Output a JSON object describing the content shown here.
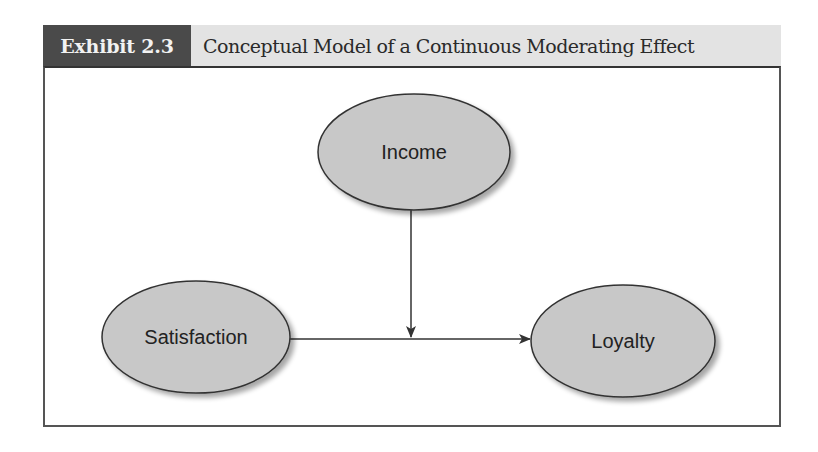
{
  "exhibit": {
    "label": "Exhibit 2.3",
    "title": "Conceptual Model of a Continuous Moderating Effect"
  },
  "diagram": {
    "nodes": [
      {
        "id": "income",
        "label": "Income",
        "role": "moderator"
      },
      {
        "id": "satisfaction",
        "label": "Satisfaction",
        "role": "independent"
      },
      {
        "id": "loyalty",
        "label": "Loyalty",
        "role": "dependent"
      }
    ],
    "edges": [
      {
        "from": "satisfaction",
        "to": "loyalty",
        "type": "direct-path"
      },
      {
        "from": "income",
        "to": "satisfaction-loyalty-path",
        "type": "moderating-effect"
      }
    ]
  },
  "colors": {
    "label_bg": "#4a4a4a",
    "title_bg": "#e3e3e3",
    "node_fill": "#c8c8c8",
    "node_stroke": "#333333",
    "arrow": "#333333"
  }
}
